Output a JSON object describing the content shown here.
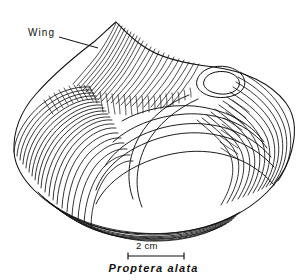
{
  "figure": {
    "background_color": "#ffffff",
    "ink_color": "#111111"
  },
  "annotations": {
    "wing_label": "Wing",
    "wing_leader_line": {
      "x1": 59,
      "y1": 37,
      "x2": 98,
      "y2": 48
    }
  },
  "scale_bar": {
    "label": "2 cm",
    "x_start": 128,
    "x_end": 184,
    "y": 256,
    "tick_height": 7
  },
  "caption": {
    "genus": "Proptera",
    "species": "alata",
    "text": "Proptera  alata"
  },
  "shell": {
    "outline_path": "M 14 152 C 13 130 22 109 38 92 C 54 74 76 56 96 40 C 104 33 111 26 116 22 C 122 27 131 37 142 45 C 160 58 186 63 213 66 C 243 70 270 82 285 102 C 296 117 296 138 289 158 C 280 182 259 203 230 217 C 198 232 158 236 122 231 C 86 226 55 210 34 189 C 21 176 15 165 14 152 Z",
    "umbo_path": "M 197 79 C 200 69 213 64 228 67 C 240 70 246 78 243 86 C 239 95 224 99 210 95 C 200 92 195 86 197 79 Z"
  }
}
